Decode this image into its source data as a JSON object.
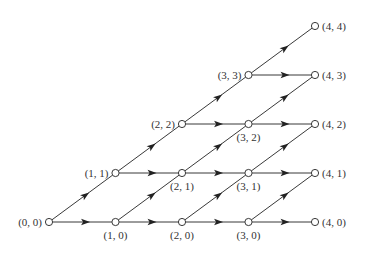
{
  "diagram": {
    "type": "lattice-graph",
    "origin": {
      "x": 49,
      "y": 222
    },
    "step_x": 66.5,
    "step_y": 49,
    "colors": {
      "line": "#222222",
      "node_fill": "#ffffff",
      "node_stroke": "#222222",
      "label": "#333333"
    },
    "nodes": [
      {
        "id": "0,0",
        "i": 0,
        "j": 0,
        "label": "(0, 0)",
        "label_pos": "left"
      },
      {
        "id": "1,0",
        "i": 1,
        "j": 0,
        "label": "(1, 0)",
        "label_pos": "below"
      },
      {
        "id": "2,0",
        "i": 2,
        "j": 0,
        "label": "(2, 0)",
        "label_pos": "below"
      },
      {
        "id": "3,0",
        "i": 3,
        "j": 0,
        "label": "(3, 0)",
        "label_pos": "below"
      },
      {
        "id": "4,0",
        "i": 4,
        "j": 0,
        "label": "(4, 0)",
        "label_pos": "right"
      },
      {
        "id": "1,1",
        "i": 1,
        "j": 1,
        "label": "(1, 1)",
        "label_pos": "left"
      },
      {
        "id": "2,1",
        "i": 2,
        "j": 1,
        "label": "(2, 1)",
        "label_pos": "below"
      },
      {
        "id": "3,1",
        "i": 3,
        "j": 1,
        "label": "(3, 1)",
        "label_pos": "below"
      },
      {
        "id": "4,1",
        "i": 4,
        "j": 1,
        "label": "(4, 1)",
        "label_pos": "right"
      },
      {
        "id": "2,2",
        "i": 2,
        "j": 2,
        "label": "(2, 2)",
        "label_pos": "left"
      },
      {
        "id": "3,2",
        "i": 3,
        "j": 2,
        "label": "(3, 2)",
        "label_pos": "below"
      },
      {
        "id": "4,2",
        "i": 4,
        "j": 2,
        "label": "(4, 2)",
        "label_pos": "right"
      },
      {
        "id": "3,3",
        "i": 3,
        "j": 3,
        "label": "(3, 3)",
        "label_pos": "left"
      },
      {
        "id": "4,3",
        "i": 4,
        "j": 3,
        "label": "(4, 3)",
        "label_pos": "right"
      },
      {
        "id": "4,4",
        "i": 4,
        "j": 4,
        "label": "(4, 4)",
        "label_pos": "right"
      }
    ],
    "edges": [
      {
        "from": "0,0",
        "to": "1,0"
      },
      {
        "from": "0,0",
        "to": "1,1"
      },
      {
        "from": "1,0",
        "to": "2,0"
      },
      {
        "from": "1,0",
        "to": "2,1"
      },
      {
        "from": "1,1",
        "to": "2,1"
      },
      {
        "from": "1,1",
        "to": "2,2"
      },
      {
        "from": "2,0",
        "to": "3,0"
      },
      {
        "from": "2,0",
        "to": "3,1"
      },
      {
        "from": "2,1",
        "to": "3,1"
      },
      {
        "from": "2,1",
        "to": "3,2"
      },
      {
        "from": "2,2",
        "to": "3,2"
      },
      {
        "from": "2,2",
        "to": "3,3"
      },
      {
        "from": "3,0",
        "to": "4,0"
      },
      {
        "from": "3,0",
        "to": "4,1"
      },
      {
        "from": "3,1",
        "to": "4,1"
      },
      {
        "from": "3,1",
        "to": "4,2"
      },
      {
        "from": "3,2",
        "to": "4,2"
      },
      {
        "from": "3,2",
        "to": "4,3"
      },
      {
        "from": "3,3",
        "to": "4,3"
      },
      {
        "from": "3,3",
        "to": "4,4"
      }
    ]
  }
}
